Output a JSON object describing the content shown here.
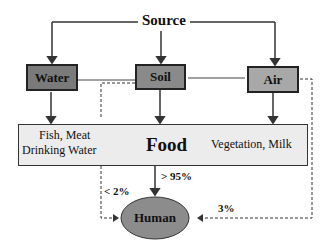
{
  "diagram": {
    "source": "Source",
    "nodes": {
      "water": "Water",
      "soil": "Soil",
      "air": "Air",
      "food": "Food",
      "human": "Human"
    },
    "food_left_line1": "Fish, Meat",
    "food_left_line2": "Drinking Water",
    "food_right": "Vegetation, Milk",
    "edges": {
      "food_to_human": "> 95%",
      "soil_to_human": "< 2%",
      "air_to_human": "3%"
    },
    "colors": {
      "water_fill": "#7a7a7a",
      "soil_fill": "#8a8a8a",
      "air_fill": "#a8a8a8",
      "food_fill": "#ececec",
      "human_fill": "#8c8c8c"
    }
  }
}
